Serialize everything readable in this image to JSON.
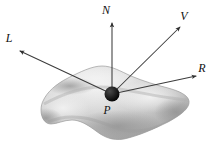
{
  "figure": {
    "kind": "phong-illumination-vectors-diagram",
    "background_color": "#ffffff",
    "line_color": "#3c3c3c",
    "point_color": "#111111",
    "surface_colors": {
      "light": "#e4e4e4",
      "mid": "#c6c6c6",
      "dark": "#a8a8a8",
      "shadow": "#8f8f8f",
      "edge": "#9a9a9a"
    }
  },
  "point": {
    "label": "P",
    "label_x": 107,
    "label_y": 114,
    "center_x": 112,
    "center_y": 94,
    "radius": 7.5
  },
  "vectors": [
    {
      "name": "normal",
      "label": "N",
      "label_x": 106,
      "label_y": 14,
      "tip_x": 112,
      "tip_y": 23,
      "tail_x": 112,
      "tail_y": 94
    },
    {
      "name": "view",
      "label": "V",
      "label_x": 184,
      "label_y": 20,
      "tip_x": 180,
      "tip_y": 27,
      "tail_x": 112,
      "tail_y": 94
    },
    {
      "name": "light",
      "label": "L",
      "label_x": 9,
      "label_y": 42,
      "tip_x": 20,
      "tip_y": 51,
      "tail_x": 112,
      "tail_y": 94
    },
    {
      "name": "reflection",
      "label": "R",
      "label_x": 202,
      "label_y": 72,
      "tip_x": 196,
      "tip_y": 76,
      "tail_x": 112,
      "tail_y": 94
    }
  ],
  "surface": {
    "name": "shaded-surface-patch",
    "outline_path": "M 43 101 C 47 92 56 84 68 78 C 80 72 92 66 102 66 C 112 66 120 71 131 76 C 143 81 156 85 168 88 C 179 91 188 95 189 101 C 190 108 181 115 168 122 C 154 129 138 136 124 139 C 112 141 104 137 96 131 C 88 125 80 120 72 120 C 64 120 57 124 51 124 C 45 124 41 118 41 110 C 41 106 42 103 43 101 Z"
  }
}
